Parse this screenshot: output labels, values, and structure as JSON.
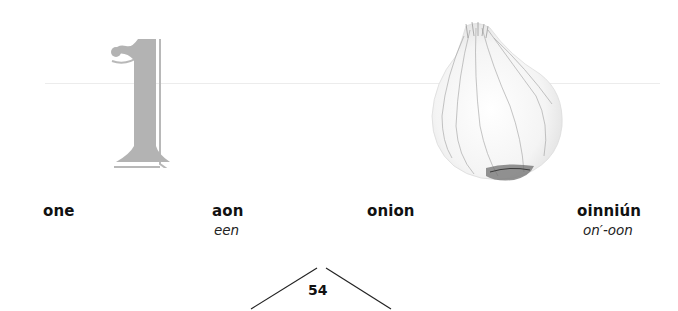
{
  "page": {
    "type": "bilingual picture dictionary",
    "languages": [
      "English",
      "Irish"
    ]
  },
  "entries": [
    {
      "illustration": "numeral-one",
      "numeral": "1",
      "english": "one",
      "irish": "aon",
      "pronunciation": "een"
    },
    {
      "illustration": "onion",
      "english": "onion",
      "irish": "oinniún",
      "pronunciation": "on′-oon"
    }
  ],
  "footer": {
    "page_number": "54",
    "decoration": "chevron-tent-lines"
  },
  "colors": {
    "numeral_fill": "#b3b3b3",
    "text": "#111111",
    "guide_line": "#ececec"
  }
}
